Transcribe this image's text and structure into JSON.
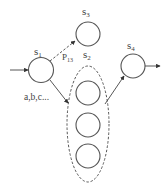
{
  "diagram": {
    "type": "state-transition",
    "states": {
      "s1": {
        "label": "s",
        "sub": "1"
      },
      "s2": {
        "label": "s",
        "sub": "2",
        "group": true,
        "inner_states": 3
      },
      "s3": {
        "label": "s",
        "sub": "3"
      },
      "s4": {
        "label": "s",
        "sub": "4"
      }
    },
    "edges": [
      {
        "id": "entry",
        "from": "",
        "to": "s1",
        "style": "solid",
        "label": ""
      },
      {
        "id": "s1-s3",
        "from": "s1",
        "to": "s3",
        "style": "dashed",
        "label": "P",
        "label_sub": "13"
      },
      {
        "id": "s1-s2",
        "from": "s1",
        "to": "s2",
        "style": "solid",
        "label": "a,b,c..."
      },
      {
        "id": "s2-s4",
        "from": "s2",
        "to": "s4",
        "style": "solid",
        "label": ""
      },
      {
        "id": "exit",
        "from": "s4",
        "to": "",
        "style": "solid",
        "label": ""
      }
    ],
    "edge_labels": {
      "p13": "P",
      "p13_sub": "13",
      "abc": "a,b,c..."
    },
    "colors": {
      "stroke": "#555555",
      "text": "#444444",
      "background": "#ffffff"
    }
  }
}
